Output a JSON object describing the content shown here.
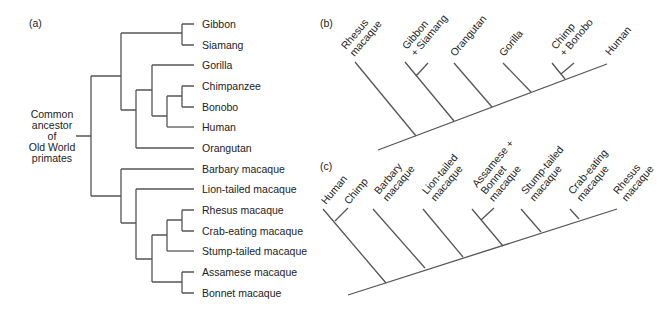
{
  "panels": {
    "a": {
      "label": "(a)",
      "root_label_lines": [
        "Common",
        "ancestor",
        "of",
        "Old World",
        "primates"
      ],
      "leaves": [
        "Gibbon",
        "Siamang",
        "Gorilla",
        "Chimpanzee",
        "Bonobo",
        "Human",
        "Orangutan",
        "Barbary macaque",
        "Lion-tailed macaque",
        "Rhesus macaque",
        "Crab-eating macaque",
        "Stump-tailed macaque",
        "Assamese macaque",
        "Bonnet macaque"
      ]
    },
    "b": {
      "label": "(b)",
      "taxa": [
        {
          "lines": [
            "Rhesus",
            "macaque"
          ]
        },
        {
          "lines": [
            "Gibbon",
            "+ Siamang"
          ]
        },
        {
          "lines": [
            "Orangutan"
          ]
        },
        {
          "lines": [
            "Gorilla"
          ]
        },
        {
          "lines": [
            "Chimp",
            "+ Bonobo"
          ]
        },
        {
          "lines": [
            "Human"
          ]
        }
      ]
    },
    "c": {
      "label": "(c)",
      "taxa": [
        {
          "lines": [
            "Human"
          ]
        },
        {
          "lines": [
            "Chimp"
          ]
        },
        {
          "lines": [
            "Barbary",
            "macaque"
          ]
        },
        {
          "lines": [
            "Lion-tailed",
            "macaque"
          ]
        },
        {
          "lines": [
            "Assamese +",
            "Bonnet",
            "macaque"
          ]
        },
        {
          "lines": [
            "Stump-tailed",
            "macaque"
          ]
        },
        {
          "lines": [
            "Crab-eating",
            "macaque"
          ]
        },
        {
          "lines": [
            "Rhesus",
            "macaque"
          ]
        }
      ]
    }
  },
  "colors": {
    "line": "#555555",
    "text": "#222222",
    "background": "#ffffff"
  }
}
